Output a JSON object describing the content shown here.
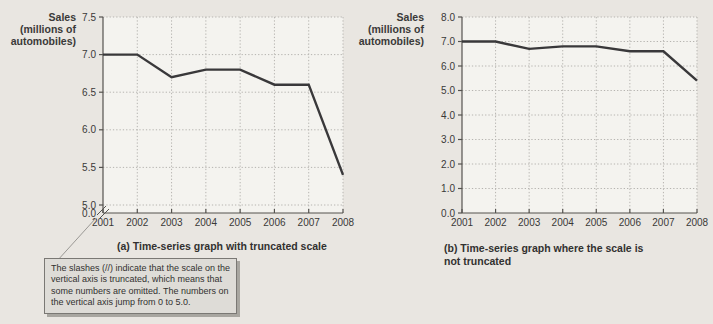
{
  "window": {
    "width": 713,
    "height": 324,
    "background": "#e9e6e1"
  },
  "colors": {
    "page_bg": "#e9e6e1",
    "plot_bg": "#f4f3ef",
    "grid": "#b6b4b0",
    "axis": "#55534f",
    "line": "#39383a",
    "text": "#3a3938",
    "callout_bg": "#dedcd7",
    "callout_border": "#7a7874",
    "callout_shadow": "#a8a6a0"
  },
  "chart_data": [
    {
      "type": "line",
      "ylabel_lines": [
        "Sales",
        "(millions of",
        "automobiles)"
      ],
      "x": [
        2001,
        2002,
        2003,
        2004,
        2005,
        2006,
        2007,
        2008
      ],
      "series": [
        {
          "name": "automobile-sales",
          "values": [
            7.0,
            7.0,
            6.7,
            6.8,
            6.8,
            6.6,
            6.6,
            5.4
          ]
        }
      ],
      "yticks": [
        7.5,
        7.0,
        6.5,
        6.0,
        5.5,
        5.0
      ],
      "ytick_labels": [
        "7.5",
        "7.0",
        "6.5",
        "6.0",
        "5.5",
        "5.0"
      ],
      "origin_label": "0.0",
      "ylim": [
        5.0,
        7.5
      ],
      "axis_truncated": true,
      "grid": true,
      "legend": "none",
      "caption_lines": [
        "(a) Time-series graph with truncated scale"
      ]
    },
    {
      "type": "line",
      "ylabel_lines": [
        "Sales",
        "(millions of",
        "automobiles)"
      ],
      "x": [
        2001,
        2002,
        2003,
        2004,
        2005,
        2006,
        2007,
        2008
      ],
      "series": [
        {
          "name": "automobile-sales",
          "values": [
            7.0,
            7.0,
            6.7,
            6.8,
            6.8,
            6.6,
            6.6,
            5.4
          ]
        }
      ],
      "yticks": [
        8.0,
        7.0,
        6.0,
        5.0,
        4.0,
        3.0,
        2.0,
        1.0,
        0.0
      ],
      "ytick_labels": [
        "8.0",
        "7.0",
        "6.0",
        "5.0",
        "4.0",
        "3.0",
        "2.0",
        "1.0",
        "0.0"
      ],
      "origin_label": "",
      "ylim": [
        0.0,
        8.0
      ],
      "axis_truncated": false,
      "grid": true,
      "legend": "none",
      "caption_lines": [
        "(b) Time-series graph where the scale is",
        "not truncated"
      ]
    }
  ],
  "callout": {
    "lines": [
      "The slashes (//) indicate that the scale on the",
      "vertical axis is truncated, which means that",
      "some numbers are omitted.  The numbers on",
      "the vertical axis jump from 0 to 5.0."
    ]
  }
}
